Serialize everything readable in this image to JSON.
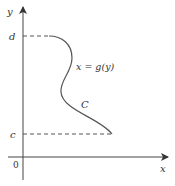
{
  "diagram": {
    "type": "curve-on-axes",
    "axes": {
      "x_label": "x",
      "y_label": "y",
      "origin_label": "0"
    },
    "y_ticks": [
      {
        "label": "d",
        "position": "top"
      },
      {
        "label": "c",
        "position": "bottom"
      }
    ],
    "curve": {
      "name": "C",
      "equation_label": "x = g(y)"
    },
    "colors": {
      "axis": "#444444",
      "curve": "#555555",
      "dashed": "#555555",
      "text": "#333333",
      "background": "#ffffff"
    }
  }
}
